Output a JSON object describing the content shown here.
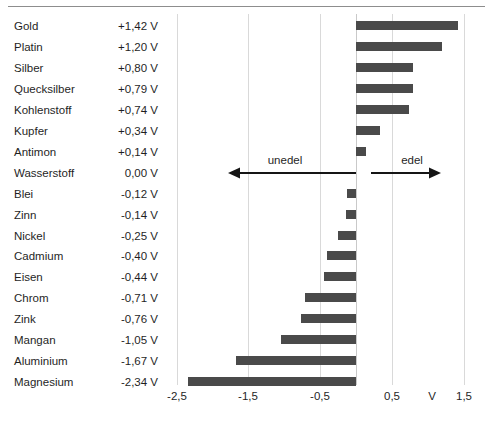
{
  "chart_data": {
    "type": "bar",
    "title": "",
    "subtitle": "",
    "xlabel": "V",
    "ylabel": "",
    "orientation": "horizontal",
    "grid": true,
    "legend": "none",
    "xlim": [
      -2.75,
      1.75
    ],
    "xticks": [
      -2.5,
      -1.5,
      -0.5,
      0.5,
      1.5
    ],
    "xtick_labels": [
      "-2,5",
      "-1,5",
      "-0,5",
      "0,5",
      "1,5"
    ],
    "axis_unit_label": "V",
    "bar_color": "#4a4a4a",
    "categories": [
      "Gold",
      "Platin",
      "Silber",
      "Quecksilber",
      "Kohlenstoff",
      "Kupfer",
      "Antimon",
      "Wasserstoff",
      "Blei",
      "Zinn",
      "Nickel",
      "Cadmium",
      "Eisen",
      "Chrom",
      "Zink",
      "Mangan",
      "Aluminium",
      "Magnesium"
    ],
    "values": [
      1.42,
      1.2,
      0.8,
      0.79,
      0.74,
      0.34,
      0.14,
      0.0,
      -0.12,
      -0.14,
      -0.25,
      -0.4,
      -0.44,
      -0.71,
      -0.76,
      -1.05,
      -1.67,
      -2.34
    ],
    "value_labels": [
      "+1,42 V",
      "+1,20 V",
      "+0,80 V",
      "+0,79 V",
      "+0,74 V",
      "+0,34 V",
      "+0,14 V",
      "0,00 V",
      "-0,12 V",
      "-0,14 V",
      "-0,25 V",
      "-0,40 V",
      "-0,44 V",
      "-0,71 V",
      "-0,76 V",
      "-1,05 V",
      "-1,67 V",
      "-2,34 V"
    ],
    "annotations": [
      {
        "text": "unedel",
        "direction": "left"
      },
      {
        "text": "edel",
        "direction": "right"
      }
    ]
  },
  "rows": [
    {
      "name": "Gold",
      "value": "+1,42 V"
    },
    {
      "name": "Platin",
      "value": "+1,20 V"
    },
    {
      "name": "Silber",
      "value": "+0,80 V"
    },
    {
      "name": "Quecksilber",
      "value": "+0,79 V"
    },
    {
      "name": "Kohlenstoff",
      "value": "+0,74 V"
    },
    {
      "name": "Kupfer",
      "value": "+0,34 V"
    },
    {
      "name": "Antimon",
      "value": "+0,14 V"
    },
    {
      "name": "Wasserstoff",
      "value": "0,00 V"
    },
    {
      "name": "Blei",
      "value": "-0,12 V"
    },
    {
      "name": "Zinn",
      "value": "-0,14 V"
    },
    {
      "name": "Nickel",
      "value": "-0,25 V"
    },
    {
      "name": "Cadmium",
      "value": "-0,40 V"
    },
    {
      "name": "Eisen",
      "value": "-0,44 V"
    },
    {
      "name": "Chrom",
      "value": "-0,71 V"
    },
    {
      "name": "Zink",
      "value": "-0,76 V"
    },
    {
      "name": "Mangan",
      "value": "-1,05 V"
    },
    {
      "name": "Aluminium",
      "value": "-1,67 V"
    },
    {
      "name": "Magnesium",
      "value": "-2,34 V"
    }
  ],
  "annotations": {
    "left_label": "unedel",
    "right_label": "edel"
  },
  "axis": {
    "unit": "V",
    "ticks": [
      "-2,5",
      "-1,5",
      "-0,5",
      "0,5",
      "1,5"
    ]
  }
}
